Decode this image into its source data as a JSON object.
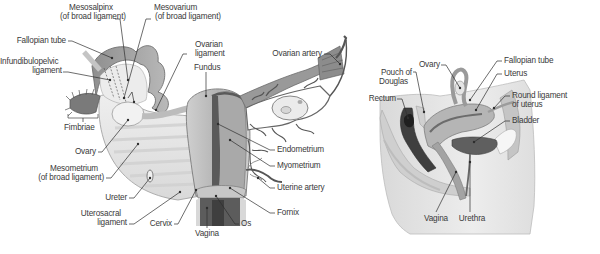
{
  "figure": {
    "panels": [
      {
        "id": "frontal-view",
        "description": "Posterior view of uterus, ovaries and broad ligament (left half sectioned)",
        "labels": [
          {
            "key": "mesosalpinx",
            "lines": [
              "Mesosalpinx",
              "(of broad ligament)"
            ]
          },
          {
            "key": "mesovarium",
            "lines": [
              "Mesovarium",
              "(of broad ligament)"
            ]
          },
          {
            "key": "fallopian_tube",
            "lines": [
              "Fallopian tube"
            ]
          },
          {
            "key": "infundibulopelvic",
            "lines": [
              "Infundibulopelvic",
              "ligament"
            ]
          },
          {
            "key": "ovarian_ligament",
            "lines": [
              "Ovarian",
              "ligament"
            ]
          },
          {
            "key": "fundus",
            "lines": [
              "Fundus"
            ]
          },
          {
            "key": "ovarian_artery",
            "lines": [
              "Ovarian artery"
            ]
          },
          {
            "key": "fimbriae",
            "lines": [
              "Fimbriae"
            ]
          },
          {
            "key": "ovary",
            "lines": [
              "Ovary"
            ]
          },
          {
            "key": "mesometrium",
            "lines": [
              "Mesometrium",
              "(of broad ligament)"
            ]
          },
          {
            "key": "ureter",
            "lines": [
              "Ureter"
            ]
          },
          {
            "key": "uterosacral",
            "lines": [
              "Uterosacral",
              "ligament"
            ]
          },
          {
            "key": "cervix",
            "lines": [
              "Cervix"
            ]
          },
          {
            "key": "vagina",
            "lines": [
              "Vagina"
            ]
          },
          {
            "key": "os",
            "lines": [
              "Os"
            ]
          },
          {
            "key": "endometrium",
            "lines": [
              "Endometrium"
            ]
          },
          {
            "key": "myometrium",
            "lines": [
              "Myometrium"
            ]
          },
          {
            "key": "uterine_artery",
            "lines": [
              "Uterine artery"
            ]
          },
          {
            "key": "fornix",
            "lines": [
              "Fornix"
            ]
          }
        ]
      },
      {
        "id": "sagittal-view",
        "description": "Midsagittal section of female pelvis",
        "labels": [
          {
            "key": "ovary",
            "lines": [
              "Ovary"
            ]
          },
          {
            "key": "pouch_of_douglas",
            "lines": [
              "Pouch of",
              "Douglas"
            ]
          },
          {
            "key": "rectum",
            "lines": [
              "Rectum"
            ]
          },
          {
            "key": "fallopian_tube",
            "lines": [
              "Fallopian tube"
            ]
          },
          {
            "key": "uterus",
            "lines": [
              "Uterus"
            ]
          },
          {
            "key": "round_ligament",
            "lines": [
              "Round ligament",
              "of uterus"
            ]
          },
          {
            "key": "bladder",
            "lines": [
              "Bladder"
            ]
          },
          {
            "key": "vagina",
            "lines": [
              "Vagina"
            ]
          },
          {
            "key": "urethra",
            "lines": [
              "Urethra"
            ]
          }
        ]
      }
    ]
  },
  "left": {
    "mesosalpinx_1": "Mesosalpinx",
    "mesosalpinx_2": "(of broad ligament)",
    "mesovarium_1": "Mesovarium",
    "mesovarium_2": "(of broad ligament)",
    "fallopian_tube": "Fallopian tube",
    "infundibulopelvic_1": "Infundibulopelvic",
    "infundibulopelvic_2": "ligament",
    "ovarian_ligament_1": "Ovarian",
    "ovarian_ligament_2": "ligament",
    "fundus": "Fundus",
    "ovarian_artery": "Ovarian artery",
    "fimbriae": "Fimbriae",
    "ovary": "Ovary",
    "mesometrium_1": "Mesometrium",
    "mesometrium_2": "(of broad ligament)",
    "ureter": "Ureter",
    "uterosacral_1": "Uterosacral",
    "uterosacral_2": "ligament",
    "cervix": "Cervix",
    "vagina": "Vagina",
    "os": "Os",
    "endometrium": "Endometrium",
    "myometrium": "Myometrium",
    "uterine_artery": "Uterine artery",
    "fornix": "Fornix"
  },
  "right": {
    "ovary": "Ovary",
    "pouch_1": "Pouch of",
    "pouch_2": "Douglas",
    "rectum": "Rectum",
    "fallopian_tube": "Fallopian tube",
    "uterus": "Uterus",
    "round_ligament_1": "Round ligament",
    "round_ligament_2": "of uterus",
    "bladder": "Bladder",
    "vagina": "Vagina",
    "urethra": "Urethra"
  },
  "colors": {
    "ink": "#2e2e2e",
    "label": "#3a3a3a",
    "tissue_light": "#e4e4e4",
    "tissue_mid": "#b9b9b9",
    "tissue_dark": "#6e6e6e",
    "cavity_dark": "#3f3f3f"
  }
}
